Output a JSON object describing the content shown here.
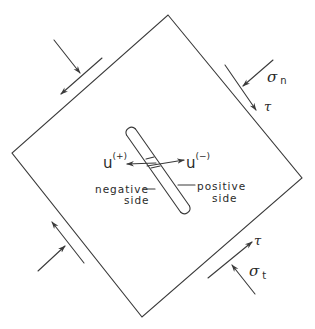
{
  "diagram": {
    "type": "stress-element-with-crack",
    "colors": {
      "stroke": "#3a3a3a",
      "text": "#2a2a2a",
      "background": "#ffffff"
    },
    "element": {
      "shape": "rotated-square",
      "corners": {
        "top": [
          168,
          15
        ],
        "right": [
          302,
          178
        ],
        "bottom": [
          142,
          317
        ],
        "left": [
          12,
          153
        ]
      }
    },
    "crack": {
      "description": "slit-shaped crack",
      "top_center": [
        131,
        132
      ],
      "bottom_center": [
        185,
        209
      ],
      "width": 10
    },
    "labels": {
      "u_plus": {
        "base": "u",
        "sup": "(+)"
      },
      "u_minus": {
        "base": "u",
        "sup": "(−)"
      },
      "negative_side": {
        "line1": "negative",
        "line2": "side"
      },
      "positive_side": {
        "line1": "positive",
        "line2": "side"
      },
      "sigma_n": {
        "base": "σ",
        "sub": "n"
      },
      "tau_top": "τ",
      "tau_bottom": "τ",
      "sigma_t": {
        "base": "σ",
        "sub": "t"
      }
    },
    "loads": [
      {
        "edge": "top-left",
        "normal": "compressive",
        "shear": "toward lower-left"
      },
      {
        "edge": "top-right",
        "normal": "σn compressive",
        "shear": "τ toward lower-right"
      },
      {
        "edge": "bottom-left",
        "normal": "compressive",
        "shear": "toward upper-left"
      },
      {
        "edge": "bottom-right",
        "normal": "σt compressive",
        "shear": "τ toward upper-right"
      }
    ]
  }
}
